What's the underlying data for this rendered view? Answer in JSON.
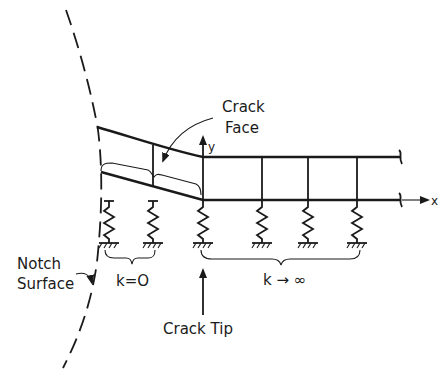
{
  "diagram": {
    "labels": {
      "crack_face": [
        "Crack",
        "Face"
      ],
      "notch_surface": [
        "Notch",
        "Surface"
      ],
      "crack_tip": "Crack Tip",
      "k_zero": "k=O",
      "k_infinity": "k → ∞",
      "axis_x": "x",
      "axis_y": "y"
    },
    "elements": {
      "springs_free_region": 2,
      "springs_bonded_region": 4,
      "crack_face_connectors": 1,
      "bonded_connectors": 3
    },
    "colors": {
      "ink": "#1a1a1a",
      "background": "#ffffff"
    }
  }
}
